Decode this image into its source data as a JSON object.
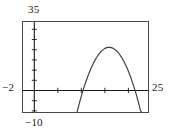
{
  "chart_data": {
    "type": "line",
    "title": "",
    "subtitle": "",
    "xlabel": "",
    "ylabel": "",
    "grid": false,
    "legend": null,
    "window": {
      "xmin": -2,
      "xmax": 25,
      "ymin": -10,
      "ymax": 35
    },
    "xlim": [
      -2,
      25
    ],
    "ylim": [
      -10,
      35
    ],
    "axis_labels": {
      "x_left": "−2",
      "x_right": "25",
      "y_top": "35",
      "y_bottom": "−10"
    },
    "tick_spacing": {
      "x": 5,
      "y": 5
    },
    "x_axis_position_y": 0,
    "y_axis_position_x": 0,
    "series": [
      {
        "name": "parabola",
        "type": "line",
        "color": "#3c3c3c",
        "equation": "y = -1.5(x - 16.2)^2 + 28.5",
        "vertex": [
          16.2,
          28.5
        ],
        "roots": [
          11.8,
          20.6
        ],
        "x": [
          9.4,
          10.0,
          10.6,
          11.2,
          11.8,
          12.4,
          13.0,
          13.6,
          14.2,
          14.8,
          15.4,
          16.0,
          16.6,
          17.2,
          17.8,
          18.4,
          19.0,
          19.6,
          20.2,
          20.8,
          21.4,
          22.0,
          22.6,
          23.0,
          23.6
        ],
        "y": [
          -10.0,
          -4.6,
          0.3,
          4.7,
          8.6,
          12.0,
          15.0,
          17.5,
          19.5,
          21.0,
          22.1,
          22.6,
          22.6,
          22.1,
          21.1,
          19.6,
          17.6,
          15.1,
          12.1,
          8.6,
          4.6,
          0.2,
          -4.8,
          -8.5,
          -10.0
        ]
      }
    ]
  },
  "labels": {
    "ymax": "35",
    "ymin": "−10",
    "xmin": "−2",
    "xmax": "25"
  },
  "colors": {
    "frame": "#4a4a4a",
    "axis": "#1a1a1a",
    "curve": "#3c3c3c",
    "text": "#1a1a1a",
    "background": "#ffffff"
  }
}
